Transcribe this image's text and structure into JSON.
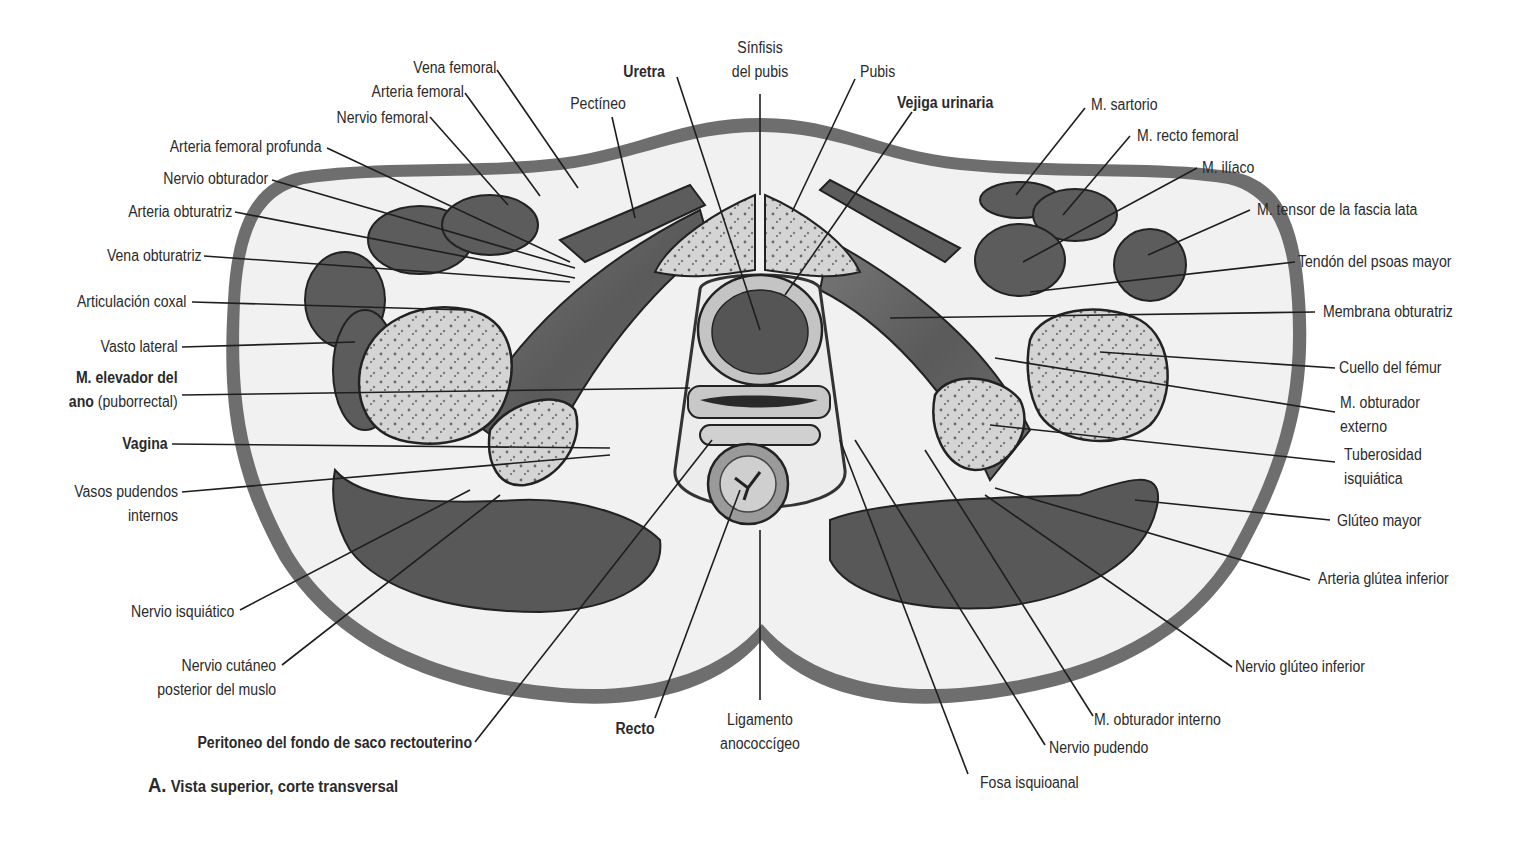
{
  "figure": {
    "caption_letter": "A.",
    "caption_text": "Vista superior, corte transversal",
    "colors": {
      "skin": "#6e6e6e",
      "fat": "#f1f1f1",
      "muscle": "#5a5a5a",
      "bone": "#d6d6d6",
      "line": "#1e1e1e"
    }
  },
  "labels_left": [
    {
      "text": "Vena femoral"
    },
    {
      "text": "Arteria femoral"
    },
    {
      "text": "Nervio femoral"
    },
    {
      "text": "Arteria femoral profunda"
    },
    {
      "text": "Nervio obturador"
    },
    {
      "text": "Arteria obturatriz"
    },
    {
      "text": "Vena obturatriz"
    },
    {
      "text": "Articulación coxal"
    },
    {
      "text": "Vasto lateral"
    },
    {
      "text_bold": "M. elevador del",
      "text_bold2": "ano",
      "text_rest": " (puborrectal)"
    },
    {
      "text": "Vagina"
    },
    {
      "text": "Vasos pudendos",
      "text2": "internos"
    },
    {
      "text": "Nervio isquiático"
    },
    {
      "text": "Nervio cutáneo",
      "text2": "posterior del muslo"
    },
    {
      "text": "Peritoneo del fondo de saco rectouterino"
    }
  ],
  "labels_top": [
    {
      "text": "Pectíneo"
    },
    {
      "text": "Uretra"
    },
    {
      "text": "Sínfisis",
      "text2": "del pubis"
    },
    {
      "text": "Pubis"
    },
    {
      "text": "Vejiga urinaria"
    }
  ],
  "labels_right": [
    {
      "text": "M. sartorio"
    },
    {
      "text": "M. recto femoral"
    },
    {
      "text": "M. ilíaco"
    },
    {
      "text": "M. tensor de la fascia lata"
    },
    {
      "text": "Tendón del psoas mayor"
    },
    {
      "text": "Membrana obturatriz"
    },
    {
      "text": "Cuello del fémur"
    },
    {
      "text": "M. obturador",
      "text2": "externo"
    },
    {
      "text": "Tuberosidad",
      "text2": "isquiática"
    },
    {
      "text": "Glúteo mayor"
    },
    {
      "text": "Arteria glútea inferior"
    },
    {
      "text": "Nervio glúteo inferior"
    }
  ],
  "labels_bottom": [
    {
      "text": "Recto"
    },
    {
      "text": "Ligamento",
      "text2": "anococcígeo"
    },
    {
      "text": "M. obturador interno"
    },
    {
      "text": "Nervio pudendo"
    },
    {
      "text": "Fosa isquioanal"
    }
  ]
}
